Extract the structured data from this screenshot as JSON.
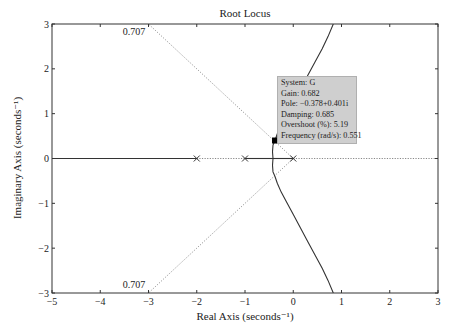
{
  "chart_data": {
    "type": "line",
    "title": "Root Locus",
    "xlabel": "Real Axis (seconds⁻¹)",
    "ylabel": "Imaginary Axis (seconds⁻¹)",
    "xlim": [
      -5,
      3
    ],
    "ylim": [
      -3,
      3
    ],
    "xticks": [
      -5,
      -4,
      -3,
      -2,
      -1,
      0,
      1,
      2,
      3
    ],
    "yticks": [
      -3,
      -2,
      -1,
      0,
      1,
      2,
      3
    ],
    "grid": false,
    "poles": [
      [
        0,
        0
      ],
      [
        -1,
        0
      ],
      [
        -2,
        0
      ]
    ],
    "series": [
      {
        "name": "branch-real-left",
        "style": "solid",
        "x": [
          -2,
          -5
        ],
        "y": [
          0,
          0
        ]
      },
      {
        "name": "branch-real-mid",
        "style": "solid",
        "x": [
          -1,
          -0.42
        ],
        "y": [
          0,
          0
        ]
      },
      {
        "name": "branch-real-right",
        "style": "solid",
        "x": [
          0,
          -0.42
        ],
        "y": [
          0,
          0
        ]
      },
      {
        "name": "branch-upper",
        "style": "solid",
        "x": [
          -0.42,
          -0.43,
          -0.42,
          -0.378,
          -0.33,
          -0.25,
          -0.15,
          0,
          0.15,
          0.3,
          0.45,
          0.6,
          0.72,
          0.83
        ],
        "y": [
          0,
          0.15,
          0.3,
          0.401,
          0.55,
          0.75,
          0.95,
          1.25,
          1.55,
          1.85,
          2.15,
          2.45,
          2.72,
          3.0
        ]
      },
      {
        "name": "branch-lower",
        "style": "solid",
        "x": [
          -0.42,
          -0.43,
          -0.42,
          -0.378,
          -0.33,
          -0.25,
          -0.15,
          0,
          0.15,
          0.3,
          0.45,
          0.6,
          0.72,
          0.83
        ],
        "y": [
          0,
          -0.15,
          -0.3,
          -0.401,
          -0.55,
          -0.75,
          -0.95,
          -1.25,
          -1.55,
          -1.85,
          -2.15,
          -2.45,
          -2.72,
          -3.0
        ]
      }
    ],
    "damping_lines": [
      {
        "zeta": 0.707,
        "x": [
          0,
          -3
        ],
        "y": [
          0,
          3
        ],
        "label": "0.707",
        "label_pos": [
          -3.3,
          2.83
        ]
      },
      {
        "zeta": 0.707,
        "x": [
          0,
          -3
        ],
        "y": [
          0,
          -3
        ],
        "label": "0.707",
        "label_pos": [
          -3.3,
          -2.83
        ]
      }
    ],
    "dotted_real_axis": [
      [
        -2,
        -1
      ],
      [
        0,
        3
      ]
    ],
    "selected_point": {
      "x": -0.378,
      "y": 0.401
    },
    "datatip": {
      "system": "System: G",
      "gain": "Gain: 0.682",
      "pole": "Pole: −0.378+0.401i",
      "damping": "Damping: 0.685",
      "overshoot": "Overshoot (%): 5.19",
      "frequency": "Frequency (rad/s): 0.551"
    }
  }
}
